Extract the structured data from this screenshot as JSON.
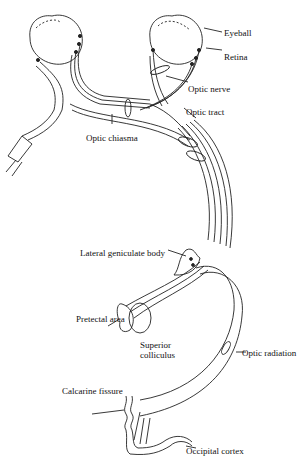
{
  "diagram": {
    "labels": {
      "eyeball": "Eyeball",
      "retina": "Retina",
      "optic_nerve": "Optic nerve",
      "optic_tract": "Optic tract",
      "optic_chiasma": "Optic chiasma",
      "lateral_geniculate_body": "Lateral geniculate body",
      "pretectal_area": "Pretectal area",
      "superior_colliculus_1": "Superior",
      "superior_colliculus_2": "colliculus",
      "optic_radiation": "Optic radiation",
      "calcarine_fissure": "Calcarine fissure",
      "occipital_cortex": "Occipital cortex"
    },
    "colors": {
      "line": "#222222",
      "background": "#ffffff"
    }
  }
}
